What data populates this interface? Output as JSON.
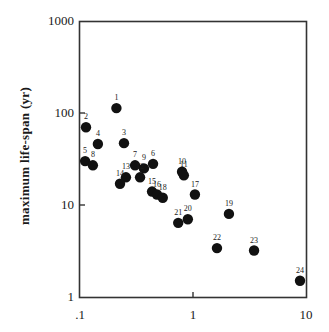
{
  "chart_data": {
    "type": "scatter",
    "title": "",
    "xlabel": "",
    "ylabel": "maximum  life-span  (yr)",
    "xscale": "log",
    "yscale": "log",
    "xlim": [
      0.1,
      10
    ],
    "ylim": [
      1,
      1000
    ],
    "x_ticks": [
      ".1",
      "1",
      "10"
    ],
    "y_ticks": [
      "1",
      "10",
      "100",
      "1000"
    ],
    "grid": false,
    "legend": null,
    "marker_color": "#111111",
    "points": [
      {
        "label": "1",
        "x": 0.21,
        "y": 113
      },
      {
        "label": "2",
        "x": 0.113,
        "y": 70
      },
      {
        "label": "3",
        "x": 0.245,
        "y": 47
      },
      {
        "label": "4",
        "x": 0.144,
        "y": 46
      },
      {
        "label": "5",
        "x": 0.111,
        "y": 30
      },
      {
        "label": "6",
        "x": 0.443,
        "y": 28
      },
      {
        "label": "7",
        "x": 0.307,
        "y": 27
      },
      {
        "label": "8",
        "x": 0.13,
        "y": 27
      },
      {
        "label": "9",
        "x": 0.368,
        "y": 25
      },
      {
        "label": "10",
        "x": 0.8,
        "y": 23
      },
      {
        "label": "11",
        "x": 0.83,
        "y": 21
      },
      {
        "label": "12",
        "x": 0.34,
        "y": 20
      },
      {
        "label": "13",
        "x": 0.255,
        "y": 20
      },
      {
        "label": "14",
        "x": 0.226,
        "y": 17
      },
      {
        "label": "15",
        "x": 0.434,
        "y": 14
      },
      {
        "label": "16",
        "x": 0.48,
        "y": 13
      },
      {
        "label": "17",
        "x": 1.04,
        "y": 13
      },
      {
        "label": "18",
        "x": 0.54,
        "y": 12
      },
      {
        "label": "19",
        "x": 2.08,
        "y": 8
      },
      {
        "label": "20",
        "x": 0.9,
        "y": 7
      },
      {
        "label": "21",
        "x": 0.74,
        "y": 6.4
      },
      {
        "label": "22",
        "x": 1.63,
        "y": 3.4
      },
      {
        "label": "23",
        "x": 3.47,
        "y": 3.2
      },
      {
        "label": "24",
        "x": 8.85,
        "y": 1.5
      }
    ]
  }
}
